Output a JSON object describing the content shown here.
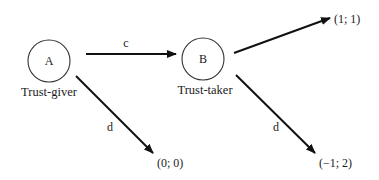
{
  "diagram": {
    "type": "trust-game-tree",
    "nodes": [
      {
        "id": "A",
        "label": "A",
        "caption": "Trust-giver"
      },
      {
        "id": "B",
        "label": "B",
        "caption": "Trust-taker"
      }
    ],
    "edges": [
      {
        "from": "A",
        "to": "B",
        "label": "c"
      },
      {
        "from": "A",
        "to": "payoff_A_d",
        "label": "d"
      },
      {
        "from": "B",
        "to": "payoff_B_c",
        "label": ""
      },
      {
        "from": "B",
        "to": "payoff_B_d",
        "label": "d"
      }
    ],
    "payoffs": {
      "payoff_A_d": "(0; 0)",
      "payoff_B_c": "(1; 1)",
      "payoff_B_d": "(−1; 2)"
    },
    "colors": {
      "background": "#ffffff",
      "ink": "#111111"
    }
  }
}
